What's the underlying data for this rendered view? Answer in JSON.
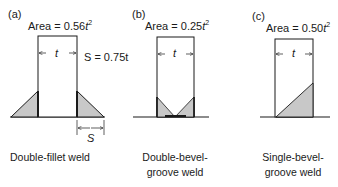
{
  "panels": [
    {
      "tag": "(a)",
      "area_prefix": "Area = ",
      "area_value": "0.56",
      "area_var": "t",
      "area_exp": "2",
      "width_label": "t",
      "size_label": "S = 0.75t",
      "size_dim_label": "S",
      "caption_line1": "Double-fillet weld",
      "caption_line2": ""
    },
    {
      "tag": "(b)",
      "area_prefix": "Area = ",
      "area_value": "0.25",
      "area_var": "t",
      "area_exp": "2",
      "width_label": "t",
      "caption_line1": "Double-bevel-",
      "caption_line2": "groove weld"
    },
    {
      "tag": "(c)",
      "area_prefix": "Area = ",
      "area_value": "0.50",
      "area_var": "t",
      "area_exp": "2",
      "width_label": "t",
      "caption_line1": "Single-bevel-",
      "caption_line2": "groove weld"
    }
  ],
  "colors": {
    "line": "#1a1a1a",
    "weld_fill": "#c8c8c8"
  }
}
